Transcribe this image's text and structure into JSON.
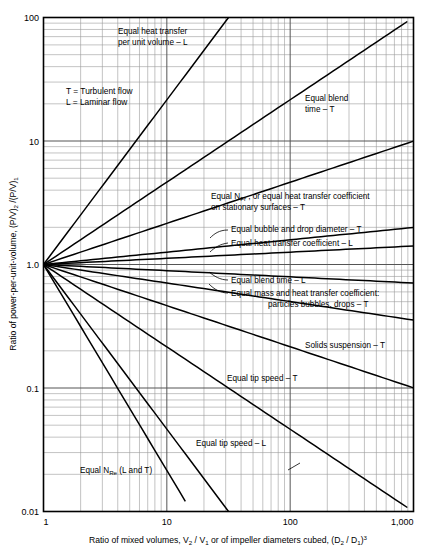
{
  "chart_data": {
    "type": "line",
    "title": "",
    "xlabel": "Ratio of mixed volumes, V2 / V1 or of impeller diameters cubed, (D2 / D1)3",
    "ylabel": "Ratio of power-per-unit-volume, (P/V)2 /(P/V)1",
    "xscale": "log",
    "yscale": "log",
    "xlim": [
      1,
      1000
    ],
    "ylim": [
      0.01,
      100
    ],
    "grid": true,
    "legend_position": "none",
    "xticks": [
      "1",
      "10",
      "100",
      "1,000"
    ],
    "xtick_values": [
      1,
      10,
      100,
      1000
    ],
    "yticks": [
      "100",
      "10",
      "1.0",
      "0.1",
      "0.01"
    ],
    "ytick_values": [
      100,
      10,
      1.0,
      0.1,
      0.01
    ],
    "legend_note_lines": [
      "T =  Turbulent flow",
      "L =  Laminar flow"
    ],
    "series": [
      {
        "name": "Equal heat transfer per unit volume - L",
        "exponent": 1.333,
        "label": "Equal heat transfer\nper unit volume – L",
        "label_x": 120,
        "label_y": 40
      },
      {
        "name": "Equal blend time - T",
        "exponent": 0.667,
        "label": "Equal blend\ntime – T",
        "label_x": 307,
        "label_y": 107
      },
      {
        "name": "Equal N_Fr, or equal heat transfer coefficient on stationary surfaces - T",
        "exponent": 0.333,
        "label": "Equal N_Fr , or equal heat transfer coefficient\non stationary surfaces – T",
        "label_x": 212,
        "label_y": 197
      },
      {
        "name": "Equal bubble and drop diameter - T",
        "exponent": 0.1,
        "label": "Equal bubble and drop diameter – T",
        "label_x": 232,
        "label_y": 230
      },
      {
        "name": "Equal heat transfer coefficient - L",
        "exponent": 0.05,
        "label": "Equal heat transfer coefficient – L",
        "label_x": 232,
        "label_y": 245
      },
      {
        "name": "Equal blend time - L",
        "exponent": -0.05,
        "label": "Equal blend time – L",
        "label_x": 232,
        "label_y": 281
      },
      {
        "name": "Equal mass and heat transfer coefficient: particles bubbles, drops - T",
        "exponent": -0.15,
        "label": "Equal mass and heat transfer coefficient:\nparticles bubbles, drops – T",
        "label_x": 232,
        "label_y": 296
      },
      {
        "name": "Solids suspension - T",
        "exponent": -0.333,
        "label": "Solids suspension – T",
        "label_x": 305,
        "label_y": 345
      },
      {
        "name": "Equal tip speed - T",
        "exponent": -0.667,
        "label": "Equal tip speed – T",
        "label_x": 228,
        "label_y": 379
      },
      {
        "name": "Equal tip speed - L",
        "exponent": -1.333,
        "label": "Equal tip speed – L",
        "label_x": 196,
        "label_y": 444
      },
      {
        "name": "Equal N_Re (L and T)",
        "exponent": -1.667,
        "label": "Equal N_Re  (L and T)",
        "label_x": 80,
        "label_y": 470
      }
    ]
  },
  "axes": {
    "x_label_parts": {
      "p1": "Ratio of mixed volumes, V",
      "s1": "2",
      "p2": " / V",
      "s2": "1",
      "p3": " or of impeller diameters cubed, (D",
      "s3": "2",
      "p4": " / D",
      "s4": "1",
      "p5": ")",
      "sup": "3"
    },
    "y_label_parts": {
      "p1": "Ratio of power-per-unit-volume, (P/V)",
      "s1": "2",
      "p2": " /(P/V)",
      "s2": "1"
    }
  },
  "annotations": {
    "heat_transfer_vol_l_1": "Equal heat transfer",
    "heat_transfer_vol_l_2": "per unit volume – L",
    "blend_time_t_1": "Equal blend",
    "blend_time_t_2": "time – T",
    "nfr_1_a": "Equal N",
    "nfr_1_sub": "Fr",
    "nfr_1_b": " , or equal heat transfer coefficient",
    "nfr_2": "on stationary surfaces – T",
    "bubble_drop_t": "Equal bubble and drop diameter – T",
    "heat_transfer_coeff_l": "Equal heat transfer coefficient – L",
    "blend_time_l": "Equal blend time – L",
    "mass_heat_1": "Equal mass and heat transfer coefficient:",
    "mass_heat_2": "particles bubbles, drops – T",
    "solids_suspension_t": "Solids suspension – T",
    "tip_speed_t": "Equal tip speed – T",
    "tip_speed_l": "Equal tip speed – L",
    "nre_a": "Equal N",
    "nre_sub": "Re",
    "nre_b": "  (L and T)",
    "legend_t": "T =  Turbulent flow",
    "legend_l": "L =  Laminar flow"
  },
  "ticks": {
    "x": [
      "1",
      "10",
      "100",
      "1,000"
    ],
    "y": [
      "100",
      "10",
      "1.0",
      "0.1",
      "0.01"
    ]
  },
  "colors": {
    "line": "#000000",
    "grid_major": "#555555",
    "grid_minor": "#9a9a9a",
    "frame": "#000000",
    "background": "#ffffff"
  }
}
